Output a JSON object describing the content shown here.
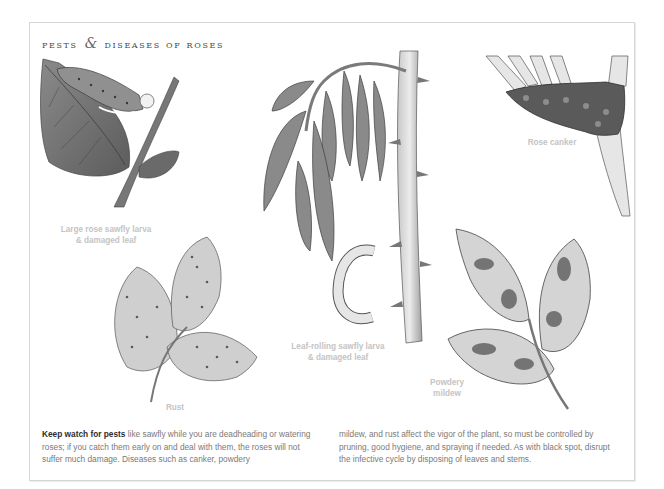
{
  "page": {
    "title_part1": "pests",
    "title_amp": "&",
    "title_part2": "diseases of roses"
  },
  "illustrations": [
    {
      "id": "large-rose-sawfly",
      "caption_line1": "Large rose sawfly larva",
      "caption_line2": "& damaged leaf"
    },
    {
      "id": "leaf-rolling-sawfly",
      "caption_line1": "Leaf-rolling sawfly larva",
      "caption_line2": "& damaged leaf"
    },
    {
      "id": "rose-canker",
      "caption_line1": "Rose canker"
    },
    {
      "id": "rust",
      "caption_line1": "Rust"
    },
    {
      "id": "powdery-mildew",
      "caption_line1": "Powdery",
      "caption_line2": "mildew"
    }
  ],
  "body": {
    "lead_bold": "Keep watch for pests",
    "col1_rest": " like sawfly while you are deadheading or watering roses; if you catch them early on and deal with them, the roses will not suffer much damage. Diseases such as canker, powdery",
    "col2": "mildew, and rust affect the vigor of the plant, so must be controlled by pruning, good hygiene, and spraying if needed. As with black spot, disrupt the infective cycle by disposing of leaves and stems."
  },
  "colors": {
    "caption": "#c4c4c4",
    "body_text": "#7a7a7a",
    "lead_text": "#2e2e2e",
    "frame_border": "#d6d6d6"
  }
}
